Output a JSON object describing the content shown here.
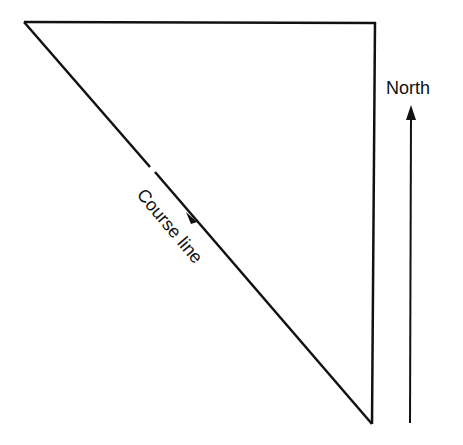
{
  "diagram": {
    "labels": {
      "north": "North",
      "course_line": "Course line"
    },
    "colors": {
      "stroke": "#111111",
      "background": "#ffffff"
    }
  }
}
